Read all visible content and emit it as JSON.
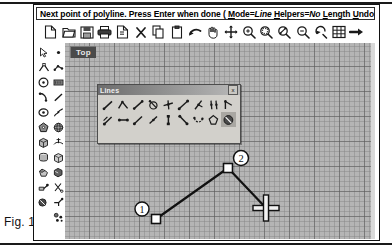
{
  "figure": {
    "caption": "Fig. 12"
  },
  "command_bar": {
    "prefix": "Next point of polyline. Press Enter when done ( ",
    "options": [
      {
        "key": "M",
        "rest": "ode=",
        "value": "Line"
      },
      {
        "key": "H",
        "rest": "elpers=",
        "value": "No"
      },
      {
        "key": "L",
        "rest": "ength",
        "value": ""
      },
      {
        "key": "U",
        "rest": "ndo",
        "value": ""
      }
    ],
    "suffix": " ):",
    "full_text": "Next point of polyline. Press Enter when done ( Mode=Line Helpers=No Length Undo ):"
  },
  "top_toolbar": {
    "items": [
      {
        "name": "new-file-icon",
        "label": "New"
      },
      {
        "name": "open-folder-icon",
        "label": "Open"
      },
      {
        "name": "save-disk-icon",
        "label": "Save"
      },
      {
        "name": "print-icon",
        "label": "Print"
      },
      {
        "name": "print-preview-icon",
        "label": "Print Preview"
      },
      {
        "name": "delete-x-icon",
        "label": "Delete"
      },
      {
        "name": "copy-icon",
        "label": "Copy"
      },
      {
        "name": "paste-icon",
        "label": "Paste"
      },
      {
        "name": "undo-arrow-icon",
        "label": "Undo"
      },
      {
        "name": "pan-hand-icon",
        "label": "Pan"
      },
      {
        "name": "move-crosshair-icon",
        "label": "Move"
      },
      {
        "name": "zoom-in-icon",
        "label": "Zoom In"
      },
      {
        "name": "zoom-window-icon",
        "label": "Zoom Window"
      },
      {
        "name": "zoom-selection-icon",
        "label": "Zoom Selection"
      },
      {
        "name": "zoom-out-icon",
        "label": "Zoom Out"
      },
      {
        "name": "zoom-previous-icon",
        "label": "Zoom Previous"
      },
      {
        "name": "grid-toggle-icon",
        "label": "Grid"
      },
      {
        "name": "arrow-right-icon",
        "label": "Next"
      }
    ]
  },
  "viewport": {
    "label": "Top",
    "grid_minor_px": 5,
    "grid_major_px": 25,
    "background_color": "#b5b5b5",
    "grid_line_color": "#5a5a5a"
  },
  "left_palette": {
    "column_one": [
      {
        "name": "select-arrow-tool",
        "label": "Select"
      },
      {
        "name": "polyline-tool",
        "label": "Polyline"
      },
      {
        "name": "circle-tool",
        "label": "Circle"
      },
      {
        "name": "arc-tool",
        "label": "Arc"
      },
      {
        "name": "ellipse-tool",
        "label": "Ellipse"
      },
      {
        "name": "polygon-tool",
        "label": "Polygon"
      },
      {
        "name": "box-solid-tool",
        "label": "Box"
      },
      {
        "name": "cylinder-tool",
        "label": "Cylinder"
      },
      {
        "name": "union-solid-tool",
        "label": "Union"
      },
      {
        "name": "extrude-tool",
        "label": "Extrude"
      },
      {
        "name": "revolve-tool",
        "label": "Revolve"
      }
    ],
    "column_two": [
      {
        "name": "point-tool",
        "label": "Point"
      },
      {
        "name": "curve-node-tool",
        "label": "Curve"
      },
      {
        "name": "dimension-tool",
        "label": "Dimension"
      },
      {
        "name": "line-segment-tool",
        "label": "Line"
      },
      {
        "name": "spline-tool",
        "label": "Spline"
      },
      {
        "name": "sphere-tool",
        "label": "Sphere"
      },
      {
        "name": "surface-tool",
        "label": "Surface"
      },
      {
        "name": "mesh-box-tool",
        "label": "Mesh Box"
      },
      {
        "name": "shade-tool",
        "label": "Shade"
      },
      {
        "name": "trim-tool",
        "label": "Trim"
      },
      {
        "name": "fillet-tool",
        "label": "Fillet"
      },
      {
        "name": "array-tool",
        "label": "Array"
      }
    ]
  },
  "lines_palette": {
    "title": "Lines",
    "close_label": "x",
    "buttons": [
      {
        "name": "line-single-icon",
        "label": "Line"
      },
      {
        "name": "line-polyline-icon",
        "label": "Polyline",
        "selected": false
      },
      {
        "name": "line-segment-icon",
        "label": "Line Segment"
      },
      {
        "name": "line-from-circle-icon",
        "label": "Tangent from Circle"
      },
      {
        "name": "line-perpendicular-icon",
        "label": "Perpendicular"
      },
      {
        "name": "line-through-points-icon",
        "label": "Through Points"
      },
      {
        "name": "line-bisector-icon",
        "label": "Bisector"
      },
      {
        "name": "line-parallel-icon",
        "label": "Parallel"
      },
      {
        "name": "line-angle-icon",
        "label": "Angle Line"
      },
      {
        "name": "line-offset-icon",
        "label": "Offset"
      },
      {
        "name": "line-horizontal-icon",
        "label": "Horizontal"
      },
      {
        "name": "line-ray-icon",
        "label": "Ray"
      },
      {
        "name": "line-tangent-icon",
        "label": "Tangent"
      },
      {
        "name": "line-vertical-icon",
        "label": "Vertical"
      },
      {
        "name": "line-chamfer-icon",
        "label": "Chamfer"
      },
      {
        "name": "line-arc-chain-icon",
        "label": "Arc Chain"
      },
      {
        "name": "line-polygon-icon",
        "label": "Polygon"
      },
      {
        "name": "line-freehand-icon",
        "label": "Freehand",
        "selected": true
      }
    ]
  },
  "drawing": {
    "type": "polyline",
    "stroke_color": "#111111",
    "vertex_fill": "#ffffff",
    "vertices": [
      {
        "label": "1",
        "x": 91,
        "y": 176,
        "callout_x": 77,
        "callout_y": 166
      },
      {
        "label": "2",
        "x": 163,
        "y": 125,
        "callout_x": 176,
        "callout_y": 115
      }
    ],
    "cursor": {
      "name": "crosshair-cursor",
      "x": 201,
      "y": 165
    },
    "rubber_band_end": {
      "x": 201,
      "y": 165
    }
  }
}
